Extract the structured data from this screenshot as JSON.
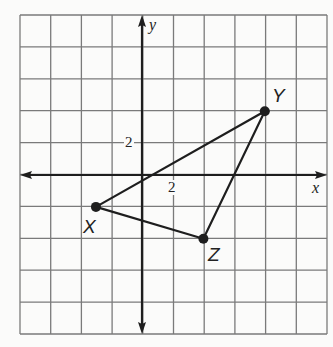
{
  "figure": {
    "grid": {
      "cols": 10,
      "rows": 10,
      "unit_per_cell": 2,
      "line_color": "#7a7a7a"
    },
    "axes": {
      "x_label": "x",
      "y_label": "y",
      "x_tick_label": "2",
      "y_tick_label": "2",
      "axis_color": "#1e1e1e"
    },
    "triangle": {
      "stroke_color": "#1e1e1e",
      "points": [
        {
          "label": "X",
          "coords": [
            -3,
            -2
          ]
        },
        {
          "label": "Y",
          "coords": [
            8,
            4
          ]
        },
        {
          "label": "Z",
          "coords": [
            4,
            -4
          ]
        }
      ]
    }
  },
  "chart_data": {
    "type": "scatter",
    "title": "",
    "xlabel": "x",
    "ylabel": "y",
    "xlim": [
      -9,
      11
    ],
    "ylim": [
      -10,
      10
    ],
    "grid": true,
    "tick_labels": {
      "x": [
        "2"
      ],
      "y": [
        "2"
      ]
    },
    "series": [
      {
        "name": "Triangle XYZ",
        "points": [
          {
            "label": "X",
            "x": -3,
            "y": -2
          },
          {
            "label": "Y",
            "x": 8,
            "y": 4
          },
          {
            "label": "Z",
            "x": 4,
            "y": -4
          }
        ],
        "connected": true,
        "closed": true
      }
    ]
  }
}
